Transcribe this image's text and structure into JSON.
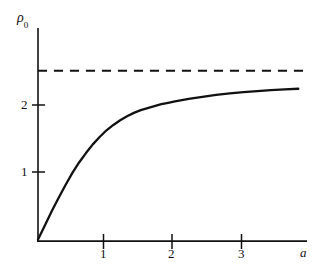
{
  "chart_data": {
    "type": "line",
    "title": "",
    "subtitle": "",
    "xlabel": "a",
    "ylabel": "ρ₀",
    "ylabel_base": "ρ",
    "ylabel_sub": "0",
    "xlim": [
      0,
      3.95
    ],
    "ylim": [
      0,
      2.95
    ],
    "grid": false,
    "legend": null,
    "xticks": [
      1,
      2,
      3
    ],
    "xtick_labels": [
      "1",
      "2",
      "3"
    ],
    "yticks": [
      1,
      2
    ],
    "ytick_labels": [
      "1",
      "2"
    ],
    "line_color": "#111111",
    "series": [
      {
        "name": "rho_0(a)",
        "style": "solid",
        "x": [
          0.0,
          0.1,
          0.2,
          0.3,
          0.4,
          0.5,
          0.6,
          0.7,
          0.8,
          0.9,
          1.0,
          1.1,
          1.2,
          1.3,
          1.4,
          1.5,
          1.6,
          1.7,
          1.8,
          1.9,
          2.0,
          2.2,
          2.4,
          2.6,
          2.8,
          3.0,
          3.2,
          3.4,
          3.6,
          3.8
        ],
        "y": [
          0.0,
          0.21,
          0.42,
          0.62,
          0.81,
          0.99,
          1.15,
          1.29,
          1.42,
          1.53,
          1.63,
          1.71,
          1.78,
          1.84,
          1.89,
          1.93,
          1.96,
          1.99,
          2.02,
          2.04,
          2.06,
          2.1,
          2.13,
          2.16,
          2.18,
          2.2,
          2.215,
          2.23,
          2.24,
          2.25
        ]
      },
      {
        "name": "asymptote",
        "style": "dashed",
        "value": 2.52,
        "x": [
          0.0,
          3.88
        ],
        "y": [
          2.52,
          2.52
        ]
      }
    ],
    "annotations": []
  },
  "axes": {
    "x_axis_name": "a",
    "y_axis_name": "ρ₀"
  }
}
